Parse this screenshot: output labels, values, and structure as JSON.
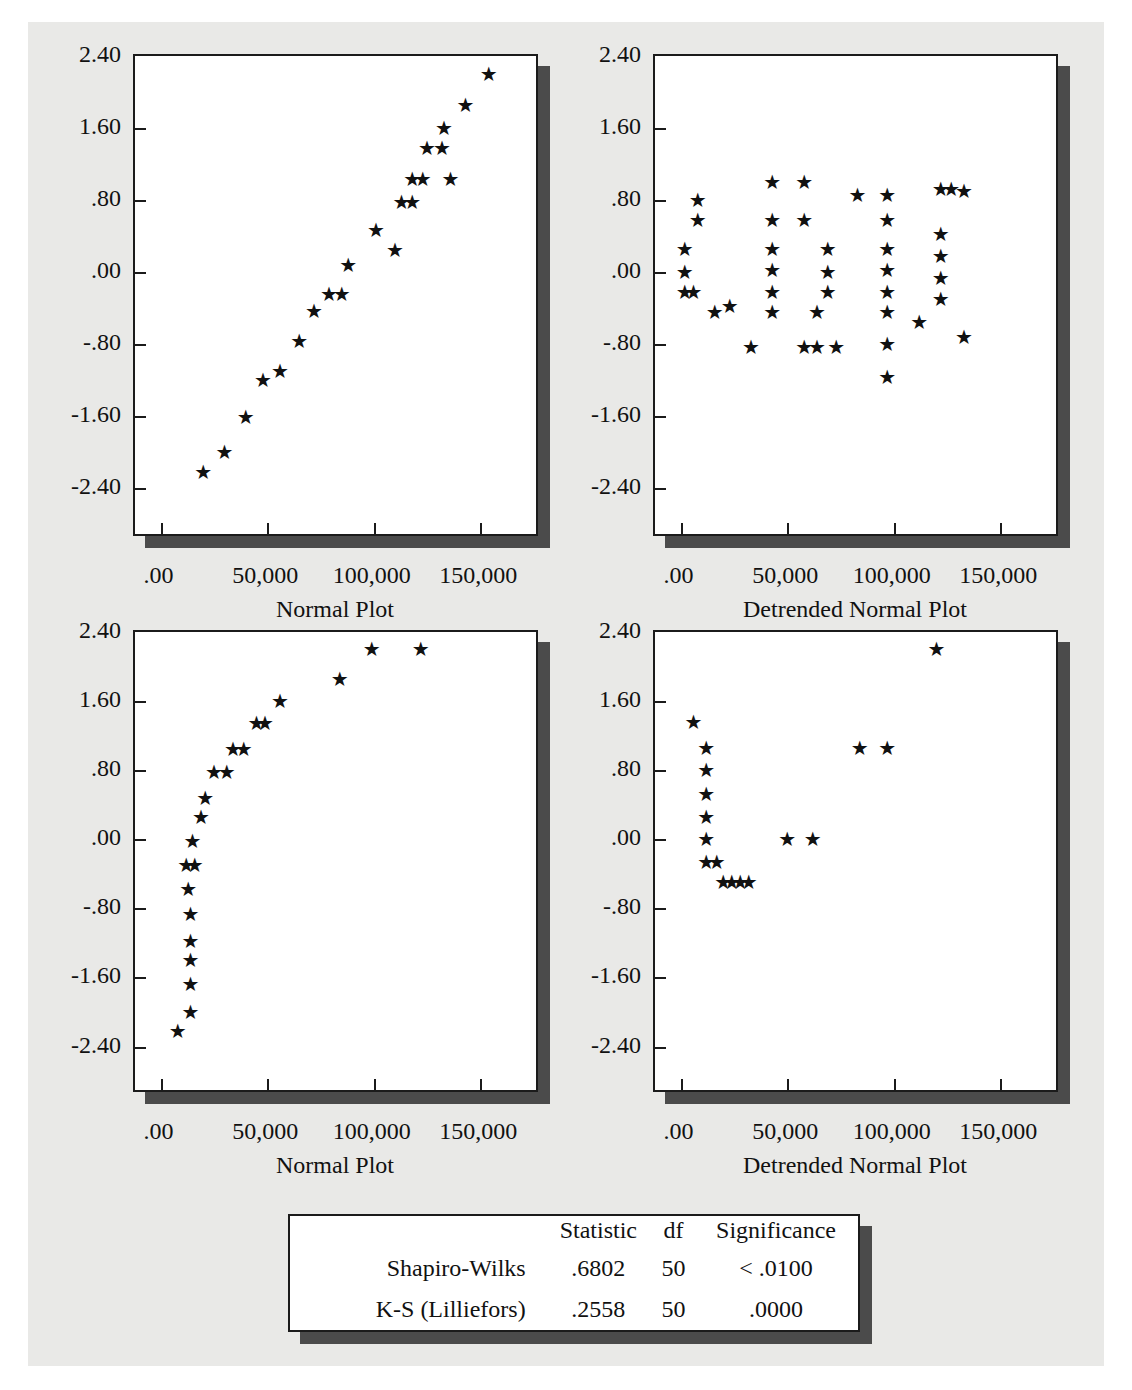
{
  "axes": {
    "y_ticks": [
      "2.40",
      "1.60",
      ".80",
      ".00",
      "-.80",
      "-1.60",
      "-2.40"
    ],
    "y_values": [
      2.4,
      1.6,
      0.8,
      0.0,
      -0.8,
      -1.6,
      -2.4
    ],
    "x_ticks": [
      ".00",
      "50,000",
      "100,000",
      "150,000"
    ],
    "x_values": [
      0,
      50000,
      100000,
      150000
    ],
    "xlim": [
      -12000,
      178000
    ],
    "ylim": [
      -2.95,
      2.4
    ],
    "ylabel": "Expected Normal",
    "star_glyph": "★"
  },
  "panels": [
    {
      "id": "top-left",
      "caption": "Normal Plot",
      "type": "normal"
    },
    {
      "id": "top-right",
      "caption": "Detrended Normal Plot",
      "type": "detrended"
    },
    {
      "id": "bottom-left",
      "caption": "Normal Plot",
      "type": "normal"
    },
    {
      "id": "bottom-right",
      "caption": "Detrended Normal Plot",
      "type": "detrended"
    }
  ],
  "stats_table": {
    "headers": [
      "",
      "Statistic",
      "df",
      "Significance"
    ],
    "rows": [
      {
        "label": "Shapiro-Wilks",
        "statistic": ".6802",
        "df": "50",
        "significance": "< .0100"
      },
      {
        "label": "K-S (Lilliefors)",
        "statistic": ".2558",
        "df": "50",
        "significance": ".0000"
      }
    ]
  },
  "colors": {
    "page_background": "#e9e9e7",
    "panel_background": "#ffffff",
    "panel_border": "#1b1b1b",
    "panel_shadow": "#4b4b4b",
    "marker": "#111111"
  },
  "chart_data": [
    {
      "type": "scatter",
      "panel": "top-left",
      "title": "Normal Plot",
      "xlabel": "Normal Plot",
      "ylabel": "Expected Normal",
      "xlim": [
        -12000,
        178000
      ],
      "ylim": [
        -2.95,
        2.4
      ],
      "xticks": [
        0,
        50000,
        100000,
        150000
      ],
      "yticks": [
        -2.4,
        -1.6,
        -0.8,
        0.0,
        0.8,
        1.6,
        2.4
      ],
      "grid": false,
      "legend": null,
      "marker": "star",
      "x": [
        20000,
        30000,
        40000,
        48000,
        56000,
        65000,
        72000,
        79000,
        85000,
        88000,
        101000,
        110000,
        113000,
        118000,
        118000,
        125000,
        123000,
        132000,
        133000,
        136000,
        143000,
        154000
      ],
      "y": [
        -2.22,
        -2.0,
        -1.61,
        -1.2,
        -1.1,
        -0.76,
        -0.43,
        -0.24,
        -0.24,
        0.08,
        0.47,
        0.25,
        0.78,
        0.78,
        1.04,
        1.38,
        1.04,
        1.38,
        1.6,
        1.04,
        1.86,
        2.2
      ]
    },
    {
      "type": "scatter",
      "panel": "top-right",
      "title": "Detrended Normal Plot",
      "xlabel": "Detrended Normal Plot",
      "ylabel": "Deviation from Normal",
      "xlim": [
        -12000,
        178000
      ],
      "ylim": [
        -2.95,
        2.4
      ],
      "xticks": [
        0,
        50000,
        100000,
        150000
      ],
      "yticks": [
        -2.4,
        -1.6,
        -0.8,
        0.0,
        0.8,
        1.6,
        2.4
      ],
      "grid": false,
      "legend": null,
      "marker": "star",
      "x": [
        8000,
        8000,
        2000,
        2000,
        2000,
        6000,
        16000,
        23000,
        33000,
        43000,
        43000,
        43000,
        43000,
        43000,
        43000,
        58000,
        58000,
        58000,
        64000,
        64000,
        69000,
        69000,
        69000,
        73000,
        83000,
        97000,
        97000,
        97000,
        97000,
        97000,
        97000,
        97000,
        97000,
        112000,
        122000,
        122000,
        122000,
        122000,
        122000,
        127000,
        133000,
        133000
      ],
      "y": [
        0.8,
        0.58,
        0.26,
        0.0,
        -0.22,
        -0.22,
        -0.44,
        -0.37,
        -0.83,
        1.0,
        0.58,
        0.26,
        0.02,
        -0.22,
        -0.44,
        1.0,
        0.58,
        -0.83,
        -0.83,
        -0.44,
        0.26,
        0.0,
        -0.22,
        -0.83,
        0.86,
        0.86,
        0.58,
        0.26,
        0.02,
        -0.22,
        -0.44,
        -0.8,
        -1.16,
        -0.55,
        0.42,
        0.18,
        -0.06,
        -0.3,
        0.92,
        0.92,
        0.9,
        -0.72
      ]
    },
    {
      "type": "scatter",
      "panel": "bottom-left",
      "title": "Normal Plot",
      "xlabel": "Normal Plot",
      "ylabel": "Expected Normal",
      "xlim": [
        -12000,
        178000
      ],
      "ylim": [
        -2.95,
        2.4
      ],
      "xticks": [
        0,
        50000,
        100000,
        150000
      ],
      "yticks": [
        -2.4,
        -1.6,
        -0.8,
        0.0,
        0.8,
        1.6,
        2.4
      ],
      "grid": false,
      "legend": null,
      "marker": "star",
      "x": [
        8000,
        14000,
        14000,
        14000,
        14000,
        14000,
        13000,
        12000,
        16000,
        15000,
        19000,
        21000,
        25000,
        31000,
        34000,
        39000,
        45000,
        49000,
        56000,
        84000,
        99000,
        122000
      ],
      "y": [
        -2.22,
        -2.0,
        -1.68,
        -1.4,
        -1.18,
        -0.86,
        -0.58,
        -0.3,
        -0.3,
        -0.02,
        0.26,
        0.48,
        0.78,
        0.78,
        1.04,
        1.04,
        1.35,
        1.35,
        1.6,
        1.86,
        2.2,
        2.2
      ]
    },
    {
      "type": "scatter",
      "panel": "bottom-right",
      "title": "Detrended Normal Plot",
      "xlabel": "Detrended Normal Plot",
      "ylabel": "Deviation from Normal",
      "xlim": [
        -12000,
        178000
      ],
      "ylim": [
        -2.95,
        2.4
      ],
      "xticks": [
        0,
        50000,
        100000,
        150000
      ],
      "yticks": [
        -2.4,
        -1.6,
        -0.8,
        0.0,
        0.8,
        1.6,
        2.4
      ],
      "grid": false,
      "legend": null,
      "marker": "star",
      "x": [
        6000,
        12000,
        12000,
        12000,
        12000,
        12000,
        12000,
        17000,
        20000,
        24000,
        28000,
        32000,
        50000,
        62000,
        84000,
        97000,
        120000
      ],
      "y": [
        1.36,
        1.06,
        0.8,
        0.52,
        0.26,
        0.0,
        -0.26,
        -0.26,
        -0.5,
        -0.5,
        -0.5,
        -0.5,
        0.0,
        0.0,
        1.06,
        1.06,
        2.2
      ]
    }
  ]
}
